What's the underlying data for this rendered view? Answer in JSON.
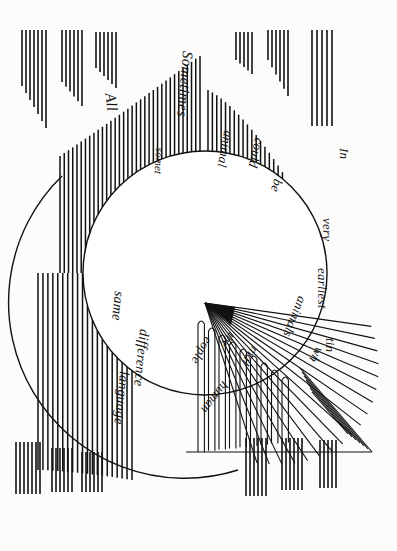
{
  "image": {
    "kind": "scanned-illustration",
    "orientation": "rotated-90-clockwise",
    "background_color": "#fbfbf9",
    "ink_color": "#111111",
    "width": 397,
    "height": 551
  },
  "diagram": {
    "title": "",
    "description_words": [
      "In",
      "very",
      "earliest",
      "times",
      "All",
      "Sometimes",
      "animal",
      "could",
      "be",
      "animals",
      "which",
      "people",
      "the",
      "human",
      "same",
      "language",
      "difference",
      "somet"
    ],
    "labels": [
      {
        "id": "l-in",
        "text": "In",
        "x": 352,
        "y": 148,
        "rot": 90,
        "size": 13
      },
      {
        "id": "l-very",
        "text": "very",
        "x": 335,
        "y": 218,
        "rot": 90,
        "size": 13
      },
      {
        "id": "l-earliest",
        "text": "earliest",
        "x": 330,
        "y": 268,
        "rot": 90,
        "size": 13
      },
      {
        "id": "l-times",
        "text": "tin",
        "x": 338,
        "y": 338,
        "rot": 90,
        "size": 13
      },
      {
        "id": "l-all",
        "text": "All",
        "x": 118,
        "y": 92,
        "rot": 82,
        "size": 15
      },
      {
        "id": "l-sometimes",
        "text": "Sometimes",
        "x": 196,
        "y": 52,
        "rot": 95,
        "size": 15
      },
      {
        "id": "l-somet",
        "text": "somet",
        "x": 166,
        "y": 148,
        "rot": 93,
        "size": 11
      },
      {
        "id": "l-animal",
        "text": "animal",
        "x": 236,
        "y": 132,
        "rot": 100,
        "size": 13
      },
      {
        "id": "l-could",
        "text": "could",
        "x": 267,
        "y": 140,
        "rot": 103,
        "size": 13
      },
      {
        "id": "l-be",
        "text": "be",
        "x": 286,
        "y": 182,
        "rot": 108,
        "size": 13
      },
      {
        "id": "l-animals",
        "text": "animals",
        "x": 310,
        "y": 300,
        "rot": 112,
        "size": 13
      },
      {
        "id": "l-which",
        "text": "wh",
        "x": 327,
        "y": 352,
        "rot": 120,
        "size": 13
      },
      {
        "id": "l-mal",
        "text": "mal",
        "x": 262,
        "y": 352,
        "rot": 123,
        "size": 13
      },
      {
        "id": "l-people",
        "text": "eople",
        "x": 216,
        "y": 342,
        "rot": 120,
        "size": 13
      },
      {
        "id": "l-the",
        "text": "the",
        "x": 238,
        "y": 338,
        "rot": 125,
        "size": 12
      },
      {
        "id": "l-human",
        "text": "human",
        "x": 232,
        "y": 388,
        "rot": 128,
        "size": 13
      },
      {
        "id": "l-same",
        "text": "same",
        "x": 127,
        "y": 292,
        "rot": 96,
        "size": 14
      },
      {
        "id": "l-difference",
        "text": "difference",
        "x": 152,
        "y": 330,
        "rot": 96,
        "size": 14
      },
      {
        "id": "l-language",
        "text": "language",
        "x": 132,
        "y": 372,
        "rot": 96,
        "size": 14
      }
    ],
    "circle": {
      "cx": 205,
      "cy": 273,
      "r": 122,
      "stroke": "#111111",
      "fill": "none"
    },
    "wedge": {
      "apex_x": 205,
      "apex_y": 303,
      "ray_count": 18,
      "start_angle_deg": 8,
      "end_angle_deg": 72,
      "note": "fan of straight rays radiating from apex toward lower-right"
    },
    "hatch_groups": [
      {
        "id": "h1",
        "x": 22,
        "y": 30,
        "count": 7,
        "spacing": 4,
        "len_start": 56,
        "len_end": 98,
        "taper": "down"
      },
      {
        "id": "h2",
        "x": 62,
        "y": 30,
        "count": 6,
        "spacing": 4,
        "len_start": 52,
        "len_end": 76,
        "taper": "down"
      },
      {
        "id": "h3",
        "x": 96,
        "y": 32,
        "count": 6,
        "spacing": 4,
        "len_start": 36,
        "len_end": 56,
        "taper": "down"
      },
      {
        "id": "h4",
        "x": 236,
        "y": 32,
        "count": 5,
        "spacing": 4,
        "len_start": 28,
        "len_end": 42,
        "taper": "down"
      },
      {
        "id": "h5",
        "x": 268,
        "y": 30,
        "count": 6,
        "spacing": 4,
        "len_start": 30,
        "len_end": 66,
        "taper": "down"
      },
      {
        "id": "h6",
        "x": 312,
        "y": 30,
        "count": 5,
        "spacing": 5,
        "len_start": 96,
        "len_end": 108,
        "taper": "flat"
      },
      {
        "id": "h7",
        "x": 16,
        "y": 442,
        "count": 7,
        "spacing": 4,
        "len_start": 52,
        "len_end": 52,
        "taper": "flat"
      },
      {
        "id": "h8",
        "x": 52,
        "y": 448,
        "count": 6,
        "spacing": 4,
        "len_start": 44,
        "len_end": 44,
        "taper": "flat"
      },
      {
        "id": "h9",
        "x": 82,
        "y": 452,
        "count": 6,
        "spacing": 4,
        "len_start": 40,
        "len_end": 40,
        "taper": "flat"
      },
      {
        "id": "h10",
        "x": 246,
        "y": 438,
        "count": 6,
        "spacing": 4,
        "len_start": 58,
        "len_end": 58,
        "taper": "flat"
      },
      {
        "id": "h11",
        "x": 282,
        "y": 438,
        "count": 6,
        "spacing": 4,
        "len_start": 52,
        "len_end": 52,
        "taper": "flat"
      },
      {
        "id": "h12",
        "x": 320,
        "y": 440,
        "count": 5,
        "spacing": 4,
        "len_start": 48,
        "len_end": 48,
        "taper": "flat"
      }
    ],
    "arc_hatch": {
      "note": "dense vertical strokes whose lower ends follow the top-left arc of the circle",
      "count": 34,
      "x_start": 60,
      "x_end": 200,
      "top_y": 96
    },
    "arc_hatch_right": {
      "note": "vertical strokes following the upper-right arc of the circle",
      "count": 22,
      "x_start": 208,
      "x_end": 300,
      "top_y": 120
    },
    "arc_hatch_bottom_left": {
      "note": "vertical strokes below the lower-left arc of the circle",
      "count": 20,
      "x_start": 38,
      "x_end": 132,
      "bottom_y": 470
    }
  }
}
